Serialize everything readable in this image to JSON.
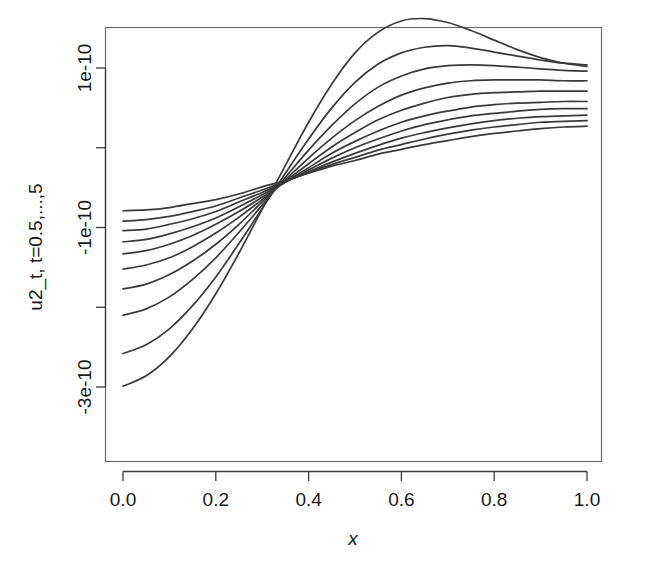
{
  "figure": {
    "background_color": "#ffffff",
    "curve_color": "#3a3a3a",
    "axis_color": "#3b3b3b",
    "frame_color": "#6e6e6e"
  },
  "chart_data": {
    "type": "line",
    "title": "",
    "subtitle": "",
    "xlabel": "x",
    "ylabel": "u2_t, t=0.5,...,5",
    "xlim": [
      0.0,
      1.0
    ],
    "ylim": [
      -3.1e-10,
      1.65e-10
    ],
    "grid": false,
    "legend": "none",
    "x_ticks": [
      0.0,
      0.2,
      0.4,
      0.6,
      0.8,
      1.0
    ],
    "x_tick_labels": [
      "0.0",
      "0.2",
      "0.4",
      "0.6",
      "0.8",
      "1.0"
    ],
    "y_ticks": [
      1e-10,
      0,
      -1e-10,
      -2e-10,
      -3e-10
    ],
    "y_tick_labels": [
      "1e-10",
      "",
      "-1e-10",
      "",
      "-3e-10"
    ],
    "x": [
      0.0,
      0.05,
      0.1,
      0.15,
      0.2,
      0.25,
      0.3,
      0.35,
      0.4,
      0.45,
      0.5,
      0.55,
      0.6,
      0.65,
      0.7,
      0.75,
      0.8,
      0.85,
      0.9,
      0.95,
      1.0
    ],
    "series": [
      {
        "name": "t=5",
        "values": [
          -2.99e-10,
          -2.86e-10,
          -2.62e-10,
          -2.27e-10,
          -1.83e-10,
          -1.32e-10,
          -7.7e-11,
          -2.2e-11,
          3.2e-11,
          8e-11,
          1.19e-10,
          1.45e-10,
          1.59e-10,
          1.62e-10,
          1.57e-10,
          1.47e-10,
          1.35e-10,
          1.23e-10,
          1.13e-10,
          1.06e-10,
          1.02e-10
        ]
      },
      {
        "name": "t=4.5",
        "values": [
          -2.58e-10,
          -2.47e-10,
          -2.27e-10,
          -1.98e-10,
          -1.62e-10,
          -1.2e-10,
          -7.6e-11,
          -3.2e-11,
          1.1e-11,
          5e-11,
          8.2e-11,
          1.05e-10,
          1.19e-10,
          1.26e-10,
          1.28e-10,
          1.25e-10,
          1.2e-10,
          1.15e-10,
          1.1e-10,
          1.06e-10,
          1.04e-10
        ]
      },
      {
        "name": "t=4",
        "values": [
          -2.1e-10,
          -2.02e-10,
          -1.87e-10,
          -1.65e-10,
          -1.38e-10,
          -1.06e-10,
          -7.2e-11,
          -3.7e-11,
          -3e-12,
          2.8e-11,
          5.5e-11,
          7.6e-11,
          9e-11,
          9.9e-11,
          1.03e-10,
          1.04e-10,
          1.03e-10,
          1.01e-10,
          9.9e-11,
          9.7e-11,
          9.6e-11
        ]
      },
      {
        "name": "t=3.5",
        "values": [
          -1.77e-10,
          -1.71e-10,
          -1.59e-10,
          -1.42e-10,
          -1.21e-10,
          -9.6e-11,
          -6.8e-11,
          -4e-11,
          -1.3e-11,
          1.2e-11,
          3.4e-11,
          5.2e-11,
          6.6e-11,
          7.5e-11,
          8.1e-11,
          8.4e-11,
          8.5e-11,
          8.5e-11,
          8.5e-11,
          8.4e-11,
          8.4e-11
        ]
      },
      {
        "name": "t=3",
        "values": [
          -1.52e-10,
          -1.47e-10,
          -1.38e-10,
          -1.24e-10,
          -1.07e-10,
          -8.7e-11,
          -6.5e-11,
          -4.2e-11,
          -2e-11,
          1e-12,
          1.9e-11,
          3.5e-11,
          4.7e-11,
          5.6e-11,
          6.3e-11,
          6.7e-11,
          6.9e-11,
          7e-11,
          7.1e-11,
          7.1e-11,
          7.1e-11
        ]
      },
      {
        "name": "t=2.5",
        "values": [
          -1.33e-10,
          -1.29e-10,
          -1.21e-10,
          -1.1e-10,
          -9.6e-11,
          -8e-11,
          -6.2e-11,
          -4.3e-11,
          -2.5e-11,
          -7e-12,
          8e-12,
          2.1e-11,
          3.2e-11,
          4e-11,
          4.6e-11,
          5.1e-11,
          5.4e-11,
          5.6e-11,
          5.7e-11,
          5.8e-11,
          5.8e-11
        ]
      },
      {
        "name": "t=2",
        "values": [
          -1.18e-10,
          -1.15e-10,
          -1.08e-10,
          -9.9e-11,
          -8.8e-11,
          -7.4e-11,
          -5.9e-11,
          -4.3e-11,
          -2.8e-11,
          -1.3e-11,
          0.0,
          1.1e-11,
          2.1e-11,
          2.9e-11,
          3.5e-11,
          4e-11,
          4.3e-11,
          4.6e-11,
          4.8e-11,
          4.9e-11,
          4.9e-11
        ]
      },
      {
        "name": "t=1.5",
        "values": [
          -1.04e-10,
          -1.02e-10,
          -9.6e-11,
          -8.9e-11,
          -8e-11,
          -6.8e-11,
          -5.6e-11,
          -4.3e-11,
          -3e-11,
          -1.8e-11,
          -7e-12,
          3e-12,
          1.2e-11,
          1.9e-11,
          2.5e-11,
          3e-11,
          3.4e-11,
          3.7e-11,
          3.9e-11,
          4e-11,
          4.1e-11
        ]
      },
      {
        "name": "t=1",
        "values": [
          -9.2e-11,
          -9e-11,
          -8.6e-11,
          -8e-11,
          -7.3e-11,
          -6.3e-11,
          -5.3e-11,
          -4.2e-11,
          -3.1e-11,
          -2.1e-11,
          -1.2e-11,
          -3e-12,
          4e-12,
          1.1e-11,
          1.7e-11,
          2.2e-11,
          2.6e-11,
          2.9e-11,
          3.2e-11,
          3.3e-11,
          3.4e-11
        ]
      },
      {
        "name": "t=0.5",
        "values": [
          -7.9e-11,
          -7.8e-11,
          -7.5e-11,
          -7e-11,
          -6.5e-11,
          -5.8e-11,
          -4.9e-11,
          -4.1e-11,
          -3.2e-11,
          -2.3e-11,
          -1.6e-11,
          -8e-12,
          -2e-12,
          4e-12,
          9e-12,
          1.4e-11,
          1.8e-11,
          2.1e-11,
          2.4e-11,
          2.6e-11,
          2.7e-11
        ]
      }
    ]
  }
}
